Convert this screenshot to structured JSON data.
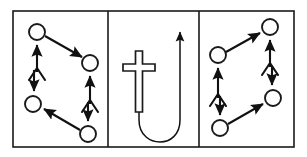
{
  "figure": {
    "background_color": "#ffffff",
    "stroke_color": "#111111",
    "frame_color": "#1a1a1a",
    "panel_count": 3,
    "frame": {
      "x": 13,
      "y": 11,
      "width": 281,
      "height": 136
    },
    "dividers": [
      108,
      199
    ]
  },
  "panels": [
    {
      "id": "left-panel",
      "label": "Left panel",
      "bounds": {
        "x": 13,
        "y": 11,
        "width": 95,
        "height": 136
      },
      "nodes": [
        {
          "id": "L-top-left",
          "cx": 37,
          "cy": 32,
          "r": 8
        },
        {
          "id": "L-mid-right",
          "cx": 90,
          "cy": 63,
          "r": 8
        },
        {
          "id": "L-mid-left",
          "cx": 33,
          "cy": 104,
          "r": 8
        },
        {
          "id": "L-bottom-right",
          "cx": 88,
          "cy": 134,
          "r": 8
        }
      ],
      "arrows": [
        {
          "id": "L-arrow-up-left",
          "from": [
            37,
            72
          ],
          "to": [
            37,
            42
          ],
          "forked_tail": true,
          "description": "upward arrow into top-left circle"
        },
        {
          "id": "L-arrow-diagonal-down",
          "from": [
            45,
            36
          ],
          "to": [
            84,
            58
          ],
          "forked_tail": false,
          "description": "diagonal arrow from top-left circle to mid-right circle"
        },
        {
          "id": "L-arrow-down-left",
          "from": [
            34,
            70
          ],
          "to": [
            34,
            94
          ],
          "forked_tail": false,
          "description": "downward arrow into mid-left circle"
        },
        {
          "id": "L-arrow-up-right",
          "from": [
            90,
            104
          ],
          "to": [
            90,
            73
          ],
          "forked_tail": true,
          "description": "upward arrow into mid-right circle"
        },
        {
          "id": "L-arrow-down-right",
          "from": [
            88,
            102
          ],
          "to": [
            88,
            124
          ],
          "forked_tail": false,
          "description": "downward arrow into bottom-right circle"
        },
        {
          "id": "L-arrow-diagonal-up",
          "from": [
            80,
            130
          ],
          "to": [
            42,
            108
          ],
          "forked_tail": false,
          "description": "diagonal arrow from bottom-right circle to mid-left circle"
        }
      ]
    },
    {
      "id": "center-panel",
      "label": "Center panel",
      "bounds": {
        "x": 108,
        "y": 11,
        "width": 91,
        "height": 136
      },
      "cross": {
        "id": "latin-cross",
        "shaft_x": 139,
        "top_y": 51,
        "bottom_y": 112,
        "arm_y": 64,
        "arm_left_x": 123,
        "arm_right_x": 155,
        "style": "outlined"
      },
      "uturn": {
        "id": "uturn-arrow",
        "start": [
          139,
          112
        ],
        "bottom_y": 138,
        "right_x": 180,
        "arrow_tip": [
          180,
          27
        ],
        "description": "U-turn path from base of cross curving down and around, then upward with arrowhead"
      }
    },
    {
      "id": "right-panel",
      "label": "Right panel",
      "bounds": {
        "x": 199,
        "y": 11,
        "width": 95,
        "height": 136
      },
      "nodes": [
        {
          "id": "R-top-right",
          "cx": 270,
          "cy": 27,
          "r": 8
        },
        {
          "id": "R-mid-left",
          "cx": 218,
          "cy": 55,
          "r": 8
        },
        {
          "id": "R-mid-right",
          "cx": 273,
          "cy": 98,
          "r": 8
        },
        {
          "id": "R-bottom-left",
          "cx": 220,
          "cy": 128,
          "r": 8
        }
      ],
      "arrows": [
        {
          "id": "R-arrow-up-right",
          "from": [
            270,
            67
          ],
          "to": [
            270,
            37
          ],
          "forked_tail": true,
          "description": "upward arrow into top-right circle"
        },
        {
          "id": "R-arrow-diagonal-up",
          "from": [
            226,
            52
          ],
          "to": [
            262,
            32
          ],
          "forked_tail": false,
          "description": "diagonal arrow from mid-left circle to top-right circle"
        },
        {
          "id": "R-arrow-up-left",
          "from": [
            218,
            98
          ],
          "to": [
            218,
            65
          ],
          "forked_tail": true,
          "description": "upward arrow into mid-left circle"
        },
        {
          "id": "R-arrow-down-right",
          "from": [
            272,
            66
          ],
          "to": [
            272,
            88
          ],
          "forked_tail": false,
          "description": "downward arrow into mid-right circle"
        },
        {
          "id": "R-arrow-down-left",
          "from": [
            220,
            96
          ],
          "to": [
            220,
            118
          ],
          "forked_tail": false,
          "description": "downward arrow into bottom-left circle"
        },
        {
          "id": "R-arrow-diagonal-up-right",
          "from": [
            228,
            124
          ],
          "to": [
            265,
            103
          ],
          "forked_tail": false,
          "description": "diagonal arrow from bottom-left circle to mid-right circle"
        }
      ]
    }
  ]
}
